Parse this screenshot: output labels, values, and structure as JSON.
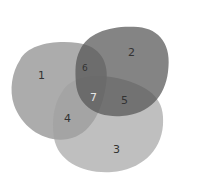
{
  "diagram": {
    "type": "venn",
    "sets": [
      {
        "id": "A",
        "color": "#a6a6a6"
      },
      {
        "id": "B",
        "color": "#6e6e6e"
      },
      {
        "id": "C",
        "color": "#b8b8b8"
      }
    ],
    "regions": [
      {
        "label": "1",
        "sets": [
          "A"
        ]
      },
      {
        "label": "2",
        "sets": [
          "B"
        ]
      },
      {
        "label": "3",
        "sets": [
          "C"
        ]
      },
      {
        "label": "4",
        "sets": [
          "A",
          "C"
        ]
      },
      {
        "label": "5",
        "sets": [
          "B",
          "C"
        ]
      },
      {
        "label": "6",
        "sets": [
          "A",
          "B"
        ]
      },
      {
        "label": "7",
        "sets": [
          "A",
          "B",
          "C"
        ]
      }
    ]
  }
}
